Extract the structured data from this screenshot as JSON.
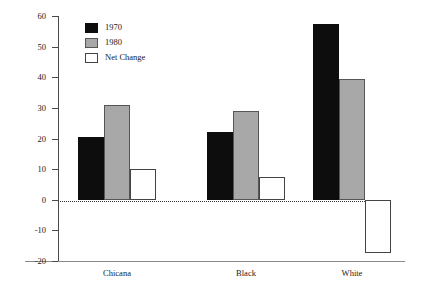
{
  "chart_data": {
    "type": "bar",
    "title": "",
    "xlabel": "",
    "ylabel": "Percentage",
    "ylim": [
      -20,
      60
    ],
    "ytick_step": 10,
    "yticks": [
      "60",
      "50",
      "40",
      "30",
      "20",
      "10",
      "0",
      "-10",
      "-20"
    ],
    "grid": false,
    "zero_line": true,
    "legend_position": "top-left",
    "categories": [
      "Chicana",
      "Black",
      "White"
    ],
    "series": [
      {
        "name": "1970",
        "color": "#0d0d0d",
        "values": [
          20.5,
          22,
          57.5
        ]
      },
      {
        "name": "1980",
        "color": "#a8a8a8",
        "values": [
          31,
          29,
          39.5
        ]
      },
      {
        "name": "Net Change",
        "color": "#ffffff",
        "values": [
          10,
          7.3,
          -17.5
        ]
      }
    ]
  },
  "axis": {
    "y_title": "Percentage"
  },
  "legend": {
    "items": [
      {
        "label": "1970",
        "swatch": "swatch-black"
      },
      {
        "label": "1980",
        "swatch": "swatch-gray"
      },
      {
        "label": "Net Change",
        "swatch": "swatch-white"
      }
    ]
  }
}
